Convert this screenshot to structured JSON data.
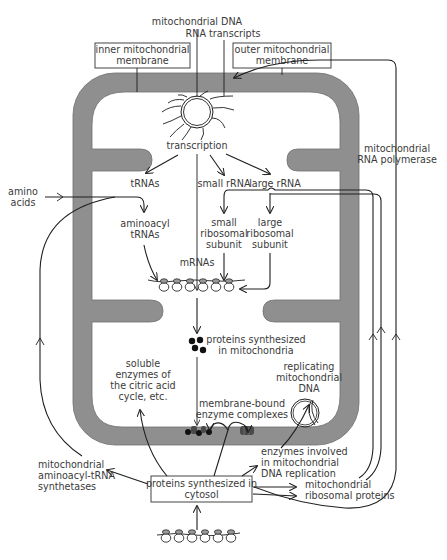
{
  "diagram": {
    "title_labels": {
      "mito_dna": "mitochondrial DNA",
      "rna_transcripts": "RNA transcripts",
      "inner_membrane": [
        "inner mitochondrial",
        "membrane"
      ],
      "outer_membrane": [
        "outer mitochondrial",
        "membrane"
      ]
    },
    "process": {
      "transcription": "transcription",
      "trnas": "tRNAs",
      "small_rrna": "small rRNA",
      "large_rrna": "large rRNA",
      "amino_acids": [
        "amino",
        "acids"
      ],
      "aminoacyl_trnas": [
        "aminoacyl",
        "tRNAs"
      ],
      "small_subunit": [
        "small",
        "ribosomal",
        "subunit"
      ],
      "large_subunit": [
        "large",
        "ribosomal",
        "subunit"
      ],
      "mrnas": "mRNAs",
      "proteins_mito": [
        "proteins synthesized",
        "in mitochondria"
      ],
      "soluble_enzymes": [
        "soluble",
        "enzymes of",
        "the citric acid",
        "cycle, etc."
      ],
      "replicating_dna": [
        "replicating",
        "mitochondrial",
        "DNA"
      ],
      "membrane_bound": [
        "membrane-bound",
        "enzyme complexes"
      ],
      "rna_polymerase": [
        "mitochondrial",
        "RNA polymerase"
      ]
    },
    "cytosol": {
      "proteins_cytosol": [
        "proteins synthesized in",
        "cytosol"
      ],
      "aminoacyl_synthetases": [
        "mitochondrial",
        "aminoacyl-tRNA",
        "synthetases"
      ],
      "dna_replication_enzymes": [
        "enzymes involved",
        "in mitochondrial",
        "DNA replication"
      ],
      "ribosomal_proteins": [
        "mitochondrial",
        "ribosomal proteins"
      ]
    },
    "colors": {
      "membrane": "#8f8f8f",
      "line": "#1e1e1e",
      "text": "#3a3a3a",
      "background": "#ffffff"
    },
    "ribosome_count": 6
  }
}
